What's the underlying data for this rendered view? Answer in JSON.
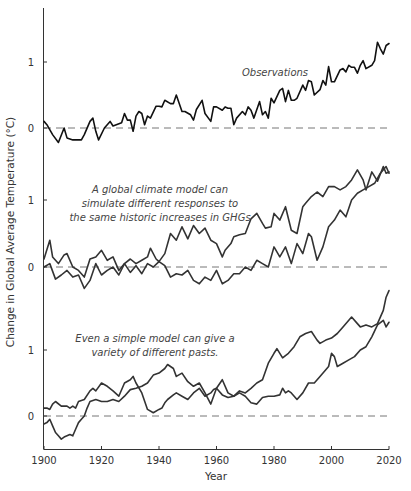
{
  "chart_data": {
    "type": "line",
    "title": "",
    "xlabel": "Year",
    "ylabel": "Change in Global Average Temperature (°C)",
    "xlim": [
      1900,
      2020
    ],
    "x_ticks": [
      "1900",
      "1920",
      "1940",
      "1960",
      "1980",
      "2000",
      "2020"
    ],
    "grid": false,
    "legend": "none",
    "panels": [
      {
        "name": "observations",
        "annotation": [
          "Observations"
        ],
        "y_ticks": [
          "0",
          "1"
        ],
        "ylim": [
          -0.3,
          1.82
        ],
        "baseline": 0,
        "color": "#111111",
        "series": [
          {
            "name": "Observations",
            "x": [
              1900,
              1901,
              1903,
              1905,
              1907,
              1908,
              1910,
              1913,
              1914,
              1916,
              1917,
              1918,
              1919,
              1921,
              1923,
              1924,
              1927,
              1928,
              1929,
              1930,
              1931,
              1932,
              1933,
              1934,
              1935,
              1936,
              1937,
              1939,
              1940,
              1941,
              1942,
              1944,
              1945,
              1946,
              1948,
              1949,
              1951,
              1952,
              1953,
              1955,
              1956,
              1958,
              1959,
              1960,
              1962,
              1963,
              1964,
              1965,
              1966,
              1967,
              1969,
              1970,
              1971,
              1972,
              1973,
              1975,
              1976,
              1977,
              1978,
              1979,
              1980,
              1982,
              1983,
              1984,
              1985,
              1986,
              1987,
              1988,
              1990,
              1991,
              1992,
              1993,
              1994,
              1996,
              1997,
              1998,
              1999,
              2000,
              2001,
              2003,
              2004,
              2005,
              2006,
              2007,
              2008,
              2009,
              2010,
              2011,
              2012,
              2014,
              2015,
              2016,
              2017,
              2018,
              2019,
              2020
            ],
            "y": [
              0.1,
              0.05,
              -0.1,
              -0.22,
              0.0,
              -0.15,
              -0.18,
              -0.18,
              -0.1,
              0.1,
              0.15,
              -0.05,
              -0.18,
              0.0,
              0.1,
              0.03,
              0.08,
              0.22,
              0.12,
              0.12,
              -0.05,
              0.18,
              0.25,
              0.22,
              0.05,
              0.18,
              0.15,
              0.33,
              0.33,
              0.32,
              0.42,
              0.37,
              0.37,
              0.5,
              0.25,
              0.25,
              0.2,
              0.12,
              0.28,
              0.42,
              0.22,
              0.1,
              0.32,
              0.32,
              0.27,
              0.32,
              0.3,
              0.3,
              0.05,
              0.15,
              0.25,
              0.2,
              0.32,
              0.27,
              0.15,
              0.4,
              0.2,
              0.25,
              0.15,
              0.45,
              0.38,
              0.57,
              0.6,
              0.4,
              0.57,
              0.42,
              0.42,
              0.45,
              0.65,
              0.57,
              0.72,
              0.7,
              0.5,
              0.58,
              0.72,
              0.65,
              0.93,
              0.7,
              0.7,
              0.88,
              0.9,
              0.85,
              0.95,
              0.92,
              0.92,
              0.83,
              0.95,
              1.02,
              0.9,
              0.95,
              1.02,
              1.3,
              1.2,
              1.12,
              1.25,
              1.28
            ]
          }
        ]
      },
      {
        "name": "global-climate-model",
        "annotation": [
          "A global climate model can",
          "simulate different responses to",
          "the same historic increases in GHGs"
        ],
        "y_ticks": [
          "0",
          "1"
        ],
        "ylim": [
          -0.55,
          1.5
        ],
        "baseline": 0,
        "color": "#333333",
        "series": [
          {
            "name": "GCM run A",
            "x": [
              1900,
              1902,
              1903,
              1905,
              1907,
              1908,
              1910,
              1912,
              1914,
              1916,
              1918,
              1920,
              1922,
              1924,
              1926,
              1928,
              1930,
              1932,
              1934,
              1936,
              1937,
              1939,
              1940,
              1942,
              1944,
              1946,
              1948,
              1950,
              1952,
              1954,
              1956,
              1958,
              1960,
              1962,
              1963,
              1965,
              1966,
              1968,
              1970,
              1972,
              1974,
              1976,
              1977,
              1979,
              1980,
              1982,
              1984,
              1986,
              1988,
              1990,
              1991,
              1993,
              1995,
              1997,
              1999,
              2001,
              2003,
              2005,
              2007,
              2009,
              2011,
              2012,
              2014,
              2016,
              2018,
              2019,
              2020
            ],
            "y": [
              0.12,
              0.4,
              0.15,
              0.05,
              0.18,
              0.2,
              0.0,
              -0.05,
              -0.15,
              0.12,
              0.15,
              0.25,
              0.1,
              0.15,
              -0.05,
              0.05,
              0.12,
              0.05,
              0.1,
              0.15,
              0.28,
              0.12,
              0.08,
              0.2,
              0.5,
              0.4,
              0.6,
              0.42,
              0.62,
              0.5,
              0.58,
              0.4,
              0.35,
              0.15,
              0.25,
              0.35,
              0.45,
              0.48,
              0.5,
              0.72,
              0.8,
              0.65,
              0.58,
              0.6,
              0.8,
              0.7,
              0.9,
              0.55,
              0.5,
              0.9,
              0.95,
              1.05,
              1.12,
              1.05,
              1.2,
              1.2,
              1.15,
              1.2,
              1.3,
              1.45,
              1.3,
              1.15,
              1.42,
              1.28,
              1.5,
              1.4,
              1.42
            ]
          },
          {
            "name": "GCM run B",
            "x": [
              1900,
              1902,
              1904,
              1906,
              1908,
              1910,
              1912,
              1914,
              1916,
              1918,
              1920,
              1922,
              1924,
              1926,
              1928,
              1930,
              1932,
              1934,
              1936,
              1938,
              1940,
              1942,
              1944,
              1946,
              1948,
              1950,
              1952,
              1954,
              1956,
              1958,
              1960,
              1962,
              1964,
              1966,
              1968,
              1970,
              1972,
              1974,
              1976,
              1978,
              1980,
              1982,
              1984,
              1986,
              1988,
              1990,
              1992,
              1993,
              1995,
              1997,
              1999,
              2001,
              2003,
              2005,
              2007,
              2009,
              2011,
              2013,
              2015,
              2017,
              2019,
              2020
            ],
            "y": [
              0.0,
              0.05,
              -0.18,
              -0.12,
              -0.05,
              -0.15,
              -0.12,
              -0.32,
              -0.2,
              0.05,
              -0.12,
              -0.05,
              0.0,
              -0.12,
              0.05,
              -0.08,
              0.02,
              -0.1,
              0.05,
              0.0,
              0.08,
              0.02,
              -0.15,
              -0.1,
              -0.12,
              -0.05,
              -0.2,
              -0.25,
              -0.15,
              -0.2,
              -0.05,
              -0.25,
              -0.2,
              -0.1,
              -0.1,
              0.0,
              -0.05,
              0.1,
              0.05,
              0.0,
              0.3,
              0.15,
              0.3,
              0.05,
              0.35,
              0.2,
              0.5,
              0.45,
              0.1,
              0.3,
              0.6,
              0.7,
              0.85,
              0.75,
              1.0,
              1.1,
              1.15,
              1.2,
              1.25,
              1.4,
              1.5,
              1.4
            ]
          }
        ]
      },
      {
        "name": "simple-model",
        "annotation": [
          "Even a simple model can give a",
          "variety of different pasts."
        ],
        "y_ticks": [
          "0",
          "1"
        ],
        "ylim": [
          -0.5,
          2.0
        ],
        "baseline": 0,
        "color": "#333333",
        "series": [
          {
            "name": "Simple model run A",
            "x": [
              1900,
              1901,
              1902,
              1903,
              1904,
              1906,
              1908,
              1909,
              1910,
              1911,
              1912,
              1914,
              1916,
              1917,
              1918,
              1920,
              1922,
              1924,
              1926,
              1928,
              1930,
              1931,
              1932,
              1934,
              1936,
              1938,
              1940,
              1941,
              1942,
              1943,
              1945,
              1946,
              1948,
              1950,
              1952,
              1954,
              1956,
              1958,
              1959,
              1960,
              1962,
              1964,
              1966,
              1968,
              1970,
              1972,
              1974,
              1976,
              1978,
              1980,
              1981,
              1983,
              1985,
              1987,
              1989,
              1991,
              1993,
              1995,
              1996,
              1998,
              2000,
              2002,
              2004,
              2006,
              2007,
              2009,
              2010,
              2012,
              2014,
              2016,
              2018,
              2019,
              2020
            ],
            "y": [
              0.12,
              0.12,
              0.1,
              0.18,
              0.22,
              0.15,
              0.15,
              0.12,
              0.15,
              0.12,
              0.22,
              0.25,
              0.38,
              0.42,
              0.38,
              0.5,
              0.45,
              0.38,
              0.3,
              0.5,
              0.55,
              0.6,
              0.5,
              0.35,
              0.1,
              0.05,
              0.1,
              0.12,
              0.2,
              0.25,
              0.32,
              0.35,
              0.3,
              0.25,
              0.35,
              0.42,
              0.3,
              0.35,
              0.4,
              0.42,
              0.32,
              0.28,
              0.3,
              0.38,
              0.35,
              0.42,
              0.5,
              0.55,
              0.8,
              0.95,
              1.02,
              0.88,
              0.95,
              1.05,
              1.2,
              1.25,
              1.28,
              1.15,
              1.1,
              1.15,
              1.18,
              1.25,
              1.35,
              1.45,
              1.5,
              1.4,
              1.35,
              1.38,
              1.35,
              1.4,
              1.6,
              1.8,
              1.9
            ]
          },
          {
            "name": "Simple model run B",
            "x": [
              1900,
              1901,
              1902,
              1903,
              1904,
              1905,
              1906,
              1907,
              1908,
              1909,
              1910,
              1911,
              1912,
              1913,
              1914,
              1915,
              1916,
              1918,
              1920,
              1922,
              1924,
              1926,
              1928,
              1930,
              1932,
              1934,
              1936,
              1938,
              1940,
              1942,
              1943,
              1945,
              1946,
              1948,
              1950,
              1952,
              1954,
              1956,
              1958,
              1960,
              1962,
              1964,
              1966,
              1968,
              1970,
              1972,
              1974,
              1976,
              1978,
              1980,
              1982,
              1983,
              1984,
              1985,
              1986,
              1988,
              1990,
              1992,
              1994,
              1996,
              1998,
              1999,
              2000,
              2001,
              2002,
              2004,
              2006,
              2008,
              2010,
              2012,
              2014,
              2016,
              2018,
              2019,
              2020
            ],
            "y": [
              -0.12,
              -0.1,
              -0.05,
              -0.15,
              -0.25,
              -0.3,
              -0.35,
              -0.32,
              -0.3,
              -0.28,
              -0.3,
              -0.2,
              -0.1,
              -0.05,
              0.0,
              0.12,
              0.22,
              0.25,
              0.22,
              0.22,
              0.25,
              0.22,
              0.3,
              0.4,
              0.42,
              0.45,
              0.5,
              0.62,
              0.65,
              0.72,
              0.78,
              0.72,
              0.6,
              0.65,
              0.52,
              0.45,
              0.5,
              0.35,
              0.18,
              0.42,
              0.55,
              0.35,
              0.3,
              0.35,
              0.3,
              0.2,
              0.18,
              0.28,
              0.3,
              0.3,
              0.32,
              0.42,
              0.35,
              0.38,
              0.35,
              0.25,
              0.35,
              0.5,
              0.5,
              0.6,
              0.7,
              0.75,
              0.95,
              0.9,
              0.75,
              0.8,
              0.85,
              0.9,
              1.0,
              1.05,
              1.2,
              1.38,
              1.45,
              1.35,
              1.42
            ]
          }
        ]
      }
    ]
  }
}
